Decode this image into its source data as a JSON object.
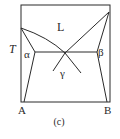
{
  "diagram": {
    "type": "binary-phase-diagram",
    "axis_label": "T",
    "components": {
      "left": "A",
      "right": "B"
    },
    "phase_labels": {
      "liquid": "L",
      "alpha": "α",
      "beta": "β",
      "gamma": "γ"
    },
    "caption": "(c)",
    "colors": {
      "line": "#2a2a2a",
      "background": "#ffffff"
    }
  }
}
